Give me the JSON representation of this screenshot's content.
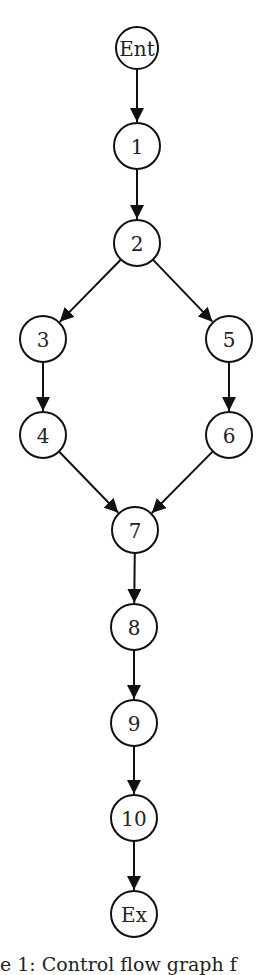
{
  "diagram": {
    "title": "Control flow graph",
    "nodes": [
      {
        "id": "Ent",
        "label": "Ent",
        "x": 137,
        "y": 48,
        "r": 21
      },
      {
        "id": "1",
        "label": "1",
        "x": 137,
        "y": 146,
        "r": 23
      },
      {
        "id": "2",
        "label": "2",
        "x": 137,
        "y": 243,
        "r": 23
      },
      {
        "id": "3",
        "label": "3",
        "x": 43,
        "y": 339,
        "r": 23
      },
      {
        "id": "5",
        "label": "5",
        "x": 229,
        "y": 339,
        "r": 23
      },
      {
        "id": "4",
        "label": "4",
        "x": 43,
        "y": 435,
        "r": 23
      },
      {
        "id": "6",
        "label": "6",
        "x": 229,
        "y": 435,
        "r": 23
      },
      {
        "id": "7",
        "label": "7",
        "x": 135,
        "y": 530,
        "r": 23
      },
      {
        "id": "8",
        "label": "8",
        "x": 134,
        "y": 627,
        "r": 23
      },
      {
        "id": "9",
        "label": "9",
        "x": 134,
        "y": 723,
        "r": 23
      },
      {
        "id": "10",
        "label": "10",
        "x": 134,
        "y": 818,
        "r": 23
      },
      {
        "id": "Ex",
        "label": "Ex",
        "x": 134,
        "y": 914,
        "r": 23
      }
    ],
    "edges": [
      [
        "Ent",
        "1"
      ],
      [
        "1",
        "2"
      ],
      [
        "2",
        "3"
      ],
      [
        "2",
        "5"
      ],
      [
        "3",
        "4"
      ],
      [
        "5",
        "6"
      ],
      [
        "4",
        "7"
      ],
      [
        "6",
        "7"
      ],
      [
        "7",
        "8"
      ],
      [
        "8",
        "9"
      ],
      [
        "9",
        "10"
      ],
      [
        "10",
        "Ex"
      ]
    ]
  },
  "caption": "e 1: Control flow graph f"
}
